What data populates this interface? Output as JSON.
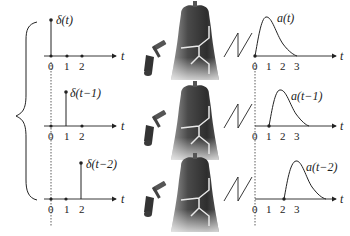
{
  "figure": {
    "axis_label": "t",
    "rows": [
      {
        "input_label": "δ(t)",
        "input_ticks": [
          "0",
          "1",
          "2"
        ],
        "output_label": "a(t)",
        "output_ticks": [
          "0",
          "1",
          "2",
          "3"
        ]
      },
      {
        "input_label": "δ(t−1)",
        "input_ticks": [
          "0",
          "1",
          "2"
        ],
        "output_label": "a(t−1)",
        "output_ticks": [
          "0",
          "1",
          "2",
          "3"
        ]
      },
      {
        "input_label": "δ(t−2)",
        "input_ticks": [
          "0",
          "1",
          "2"
        ],
        "output_label": "a(t−2)",
        "output_ticks": [
          "0",
          "1",
          "2",
          "3"
        ]
      }
    ],
    "icons": [
      "brace-icon",
      "hammer-icon",
      "bell-icon",
      "lightning-icon"
    ],
    "colors": {
      "line": "#222222",
      "bell_dark": "#3a3a3a",
      "bell_light": "#d8d8d8",
      "crack": "#e8e8e8"
    }
  }
}
